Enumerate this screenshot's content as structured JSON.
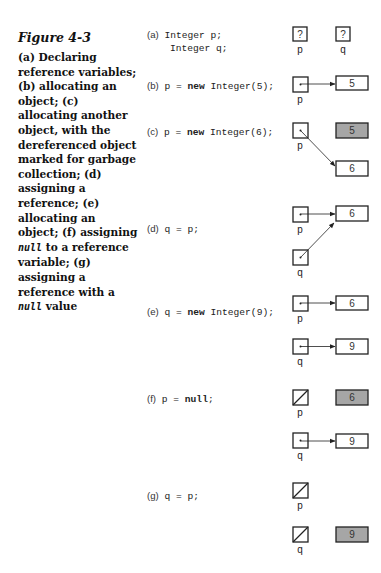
{
  "figure": {
    "title": "Figure 4-3",
    "caption_parts": [
      "(a) Declaring reference variables; (b) allocating an object; (c) allocating another object, with the dereferenced object marked for garbage collection; (d) assigning a reference; (e) allocating an object; (f) assigning ",
      "null",
      " to a reference variable; (g) assigning a reference with a ",
      "null",
      " value"
    ]
  },
  "steps": [
    {
      "label": "(a)",
      "code_line1": "Integer p;",
      "code_line2": "Integer q;"
    },
    {
      "label": "(b)",
      "code_pre": "p = ",
      "keyword": "new",
      "code_post": " Integer(5);"
    },
    {
      "label": "(c)",
      "code_pre": "p = ",
      "keyword": "new",
      "code_post": " Integer(6);"
    },
    {
      "label": "(d)",
      "code_pre": "q = p;",
      "keyword": "",
      "code_post": ""
    },
    {
      "label": "(e)",
      "code_pre": "q = ",
      "keyword": "new",
      "code_post": " Integer(9);"
    },
    {
      "label": "(f)",
      "code_pre": "p = ",
      "keyword": "null",
      "code_post": ";"
    },
    {
      "label": "(g)",
      "code_pre": "q = p;",
      "keyword": "",
      "code_post": ""
    }
  ],
  "diagram_text": {
    "unknown": "?",
    "var_p": "p",
    "var_q": "q",
    "val_5": "5",
    "val_6": "6",
    "val_9": "9"
  },
  "colors": {
    "garbage_fill": "#a6a6a6",
    "box_stroke": "#222222"
  }
}
